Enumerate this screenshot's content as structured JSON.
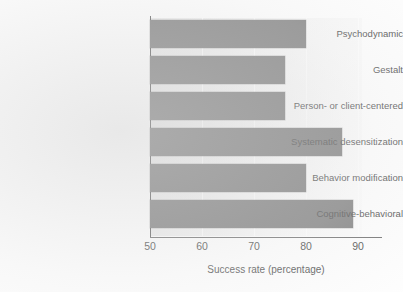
{
  "chart_data": {
    "type": "bar",
    "orientation": "horizontal",
    "title": "",
    "xlabel": "Success rate (percentage)",
    "ylabel": "",
    "categories": [
      "Psychodynamic",
      "Gestalt",
      "Person- or client-centered",
      "Systematic desensitization",
      "Behavior modification",
      "Cognitive-behavioral"
    ],
    "values": [
      80,
      76,
      76,
      87,
      80,
      89
    ],
    "xlim": [
      50,
      94.5
    ],
    "xticks": [
      50,
      60,
      70,
      80,
      90
    ],
    "xtick_labels": [
      "50",
      "60",
      "70",
      "80",
      "90"
    ],
    "grid": "vertical-only",
    "legend": "none",
    "bar_color": "#7b7b7b",
    "plot_background": "#f0f0f0",
    "axis_color": "#5a5a5a",
    "text_color": "#4a4a4a"
  }
}
